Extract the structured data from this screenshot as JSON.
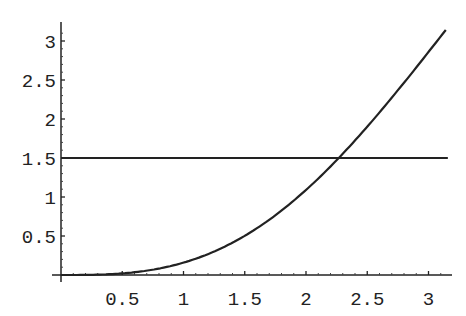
{
  "chart_data": {
    "type": "line",
    "title": "",
    "xlabel": "",
    "ylabel": "",
    "xlim": [
      0,
      3.14159
    ],
    "ylim": [
      0,
      3.14159
    ],
    "grid": false,
    "legend": null,
    "x_ticks": [
      "0.5",
      "1",
      "1.5",
      "2",
      "2.5",
      "3"
    ],
    "y_ticks": [
      "0.5",
      "1",
      "1.5",
      "2",
      "2.5",
      "3"
    ],
    "series": [
      {
        "name": "curve",
        "description": "increasing convex curve, resembles x - sin(x)",
        "x": [
          0,
          0.25,
          0.5,
          0.75,
          1.0,
          1.25,
          1.5,
          1.75,
          2.0,
          2.25,
          2.5,
          2.75,
          3.0,
          3.14159
        ],
        "values": [
          0,
          0.003,
          0.021,
          0.068,
          0.159,
          0.301,
          0.503,
          0.766,
          1.091,
          1.472,
          1.902,
          2.369,
          2.859,
          3.14159
        ]
      },
      {
        "name": "horizontal-line",
        "description": "constant line y = 1.5",
        "x": [
          0,
          3.14159
        ],
        "values": [
          1.5,
          1.5
        ]
      }
    ],
    "annotations": [
      {
        "type": "intersection",
        "x": 2.26,
        "y": 1.5
      }
    ]
  },
  "axes": {
    "x_tick_labels": [
      "0.5",
      "1",
      "1.5",
      "2",
      "2.5",
      "3"
    ],
    "y_tick_labels": [
      "0.5",
      "1",
      "1.5",
      "2",
      "2.5",
      "3"
    ]
  }
}
